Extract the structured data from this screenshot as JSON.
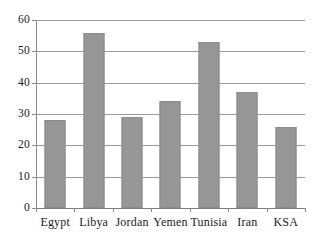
{
  "chart_data": {
    "type": "bar",
    "title": "",
    "subtitle": "",
    "xlabel": "",
    "ylabel": "",
    "categories": [
      "Egypt",
      "Libya",
      "Jordan",
      "Yemen",
      "Tunisia",
      "Iran",
      "KSA"
    ],
    "values": [
      28,
      56,
      29,
      34,
      53,
      37,
      26
    ],
    "ylim": [
      0,
      60
    ],
    "ytick_labels": [
      "0",
      "10",
      "20",
      "30",
      "40",
      "50",
      "60"
    ],
    "ytick_values": [
      0,
      10,
      20,
      30,
      40,
      50,
      60
    ],
    "grid": "horizontal",
    "legend": "none",
    "series": [
      {
        "name": "",
        "values": [
          28,
          56,
          29,
          34,
          53,
          37,
          26
        ],
        "color": "#969696"
      }
    ],
    "colors": {
      "bar_fill": "#969696",
      "bar_border": "#8c8c8c",
      "gridline": "#9a9a9a",
      "axis": "#8a8a8a",
      "background": "#ffffff",
      "text": "#1a1a1a"
    }
  }
}
